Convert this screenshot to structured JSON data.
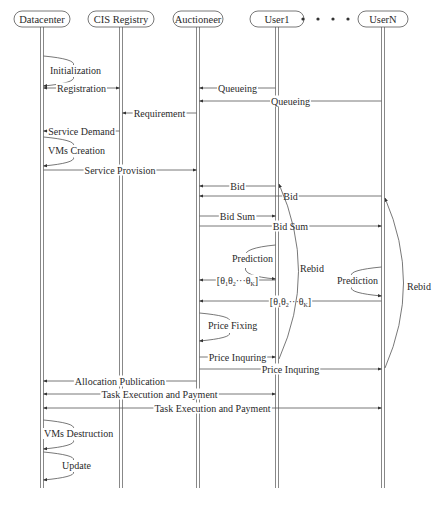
{
  "participants": [
    {
      "id": "datacenter",
      "label": "Datacenter",
      "x": 42,
      "w": 56
    },
    {
      "id": "cis",
      "label": "CIS Registry",
      "x": 121,
      "w": 66
    },
    {
      "id": "auctioneer",
      "label": "Auctioneer",
      "x": 198,
      "w": 50
    },
    {
      "id": "user1",
      "label": "User1",
      "x": 277,
      "w": 54
    },
    {
      "id": "usern",
      "label": "UserN",
      "x": 383,
      "w": 50
    }
  ],
  "ellipsis": "• • • •",
  "messages": [
    {
      "label": "Initialization",
      "type": "self",
      "on": "datacenter",
      "y1": 56,
      "y2": 86,
      "lx": 50,
      "ly": 74
    },
    {
      "label": "Registration",
      "from": "datacenter",
      "to": "cis",
      "y": 88,
      "bidir": true
    },
    {
      "label": "Queueing",
      "from": "user1",
      "to": "auctioneer",
      "y": 88
    },
    {
      "label": "Queueing",
      "from": "usern",
      "to": "auctioneer",
      "y": 101
    },
    {
      "label": "Requirement",
      "from": "auctioneer",
      "to": "cis",
      "y": 113
    },
    {
      "label": "Service Demand",
      "from": "cis",
      "to": "datacenter",
      "y": 131
    },
    {
      "label": "VMs Creation",
      "type": "self",
      "on": "datacenter",
      "y1": 137,
      "y2": 166,
      "lx": 48,
      "ly": 154
    },
    {
      "label": "Service Provision",
      "from": "datacenter",
      "to": "auctioneer",
      "y": 170
    },
    {
      "label": "Bid",
      "from": "user1",
      "to": "auctioneer",
      "y": 186
    },
    {
      "label": "Bid",
      "from": "usern",
      "to": "auctioneer",
      "y": 196
    },
    {
      "label": "Bid Sum",
      "from": "auctioneer",
      "to": "user1",
      "y": 216
    },
    {
      "label": "Bid Sum",
      "from": "auctioneer",
      "to": "usern",
      "y": 226
    },
    {
      "label": "Prediction",
      "type": "self-left",
      "on": "user1",
      "y1": 245,
      "y2": 279,
      "lx": 232,
      "ly": 262
    },
    {
      "label": "[θ₁θ₂···θ_K]",
      "from": "user1",
      "to": "auctioneer",
      "y": 280
    },
    {
      "label": "Prediction",
      "type": "self-left",
      "on": "usern",
      "y1": 267,
      "y2": 296,
      "lx": 337,
      "ly": 284
    },
    {
      "label": "[θ₁θ₂···θ_K]",
      "from": "usern",
      "to": "auctioneer",
      "y": 301
    },
    {
      "label": "Price Fixing",
      "type": "self",
      "on": "auctioneer",
      "y1": 313,
      "y2": 341,
      "lx": 208,
      "ly": 329
    },
    {
      "label": "Price Inquring",
      "from": "auctioneer",
      "to": "user1",
      "y": 357
    },
    {
      "label": "Price Inquring",
      "from": "auctioneer",
      "to": "usern",
      "y": 369
    },
    {
      "label": "Allocation Publication",
      "from": "auctioneer",
      "to": "datacenter",
      "y": 381
    },
    {
      "label": "Task Execution and Payment",
      "from": "datacenter",
      "to": "user1",
      "y": 394,
      "bidir": true
    },
    {
      "label": "Task Execution and Payment",
      "from": "datacenter",
      "to": "usern",
      "y": 408,
      "bidir": true
    },
    {
      "label": "VMs Destruction",
      "type": "self",
      "on": "datacenter",
      "y1": 420,
      "y2": 449,
      "lx": 44,
      "ly": 437
    },
    {
      "label": "Update",
      "type": "self",
      "on": "datacenter",
      "y1": 452,
      "y2": 480,
      "lx": 62,
      "ly": 469
    }
  ],
  "rebid": [
    {
      "label": "Rebid",
      "on": "user1",
      "y1": 184,
      "y2": 359,
      "bulge": 300,
      "lx": 300,
      "ly": 272
    },
    {
      "label": "Rebid",
      "on": "usern",
      "y1": 198,
      "y2": 368,
      "bulge": 404,
      "lx": 407,
      "ly": 290
    }
  ]
}
